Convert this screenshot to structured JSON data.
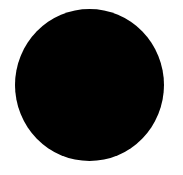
{
  "canvas": {
    "background": "#ffffff"
  },
  "shape": {
    "type": "circle",
    "fill": "#000000"
  }
}
